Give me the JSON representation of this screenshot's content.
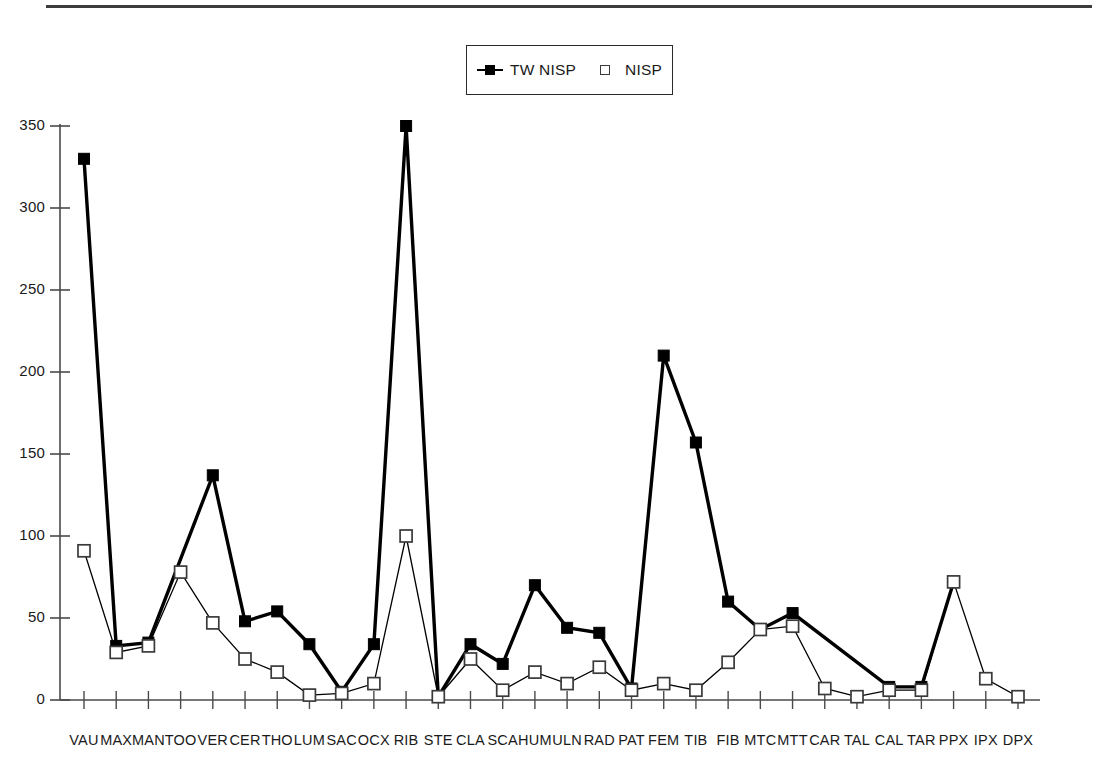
{
  "legend": {
    "entries": [
      {
        "label": "TW NISP",
        "marker": "filled-square",
        "color": "#000000"
      },
      {
        "label": "NISP",
        "marker": "open-square",
        "color": "#ffffff"
      }
    ]
  },
  "axes": {
    "y_ticks": [
      "0",
      "50",
      "100",
      "150",
      "200",
      "250",
      "300",
      "350"
    ],
    "y_min": 0,
    "y_max": 350,
    "y_step": 50,
    "axis_color": "#4a4a4a"
  },
  "chart_data": {
    "type": "line",
    "title": "",
    "xlabel": "",
    "ylabel": "",
    "ylim": [
      0,
      350
    ],
    "grid": false,
    "legend_position": "top-center",
    "categories": [
      "VAU",
      "MAX",
      "MAN",
      "TOO",
      "VER",
      "CER",
      "THO",
      "LUM",
      "SAC",
      "OCX",
      "RIB",
      "STE",
      "CLA",
      "SCA",
      "HUM",
      "ULN",
      "RAD",
      "PAT",
      "FEM",
      "TIB",
      "FIB",
      "MTC",
      "MTT",
      "CAR",
      "TAL",
      "CAL",
      "TAR",
      "PPX",
      "IPX",
      "DPX"
    ],
    "series": [
      {
        "name": "TW NISP",
        "marker": "filled-square",
        "color": "#000000",
        "values": [
          330,
          33,
          35,
          null,
          137,
          48,
          54,
          34,
          5,
          34,
          350,
          2,
          34,
          22,
          70,
          44,
          41,
          7,
          210,
          157,
          60,
          43,
          53,
          null,
          null,
          8,
          8,
          72,
          null,
          null
        ]
      },
      {
        "name": "NISP",
        "marker": "open-square",
        "color": "#ffffff",
        "values": [
          91,
          29,
          33,
          78,
          47,
          25,
          17,
          3,
          4,
          10,
          100,
          2,
          25,
          6,
          17,
          10,
          20,
          6,
          10,
          6,
          23,
          43,
          45,
          7,
          2,
          6,
          6,
          72,
          13,
          2
        ]
      }
    ]
  }
}
